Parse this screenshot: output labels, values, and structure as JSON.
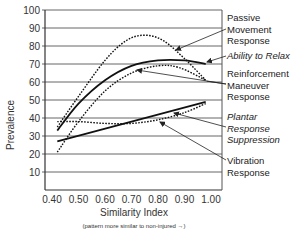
{
  "chart_data": {
    "type": "line",
    "title": "",
    "xlabel": "Similarity Index",
    "xlabel_note": "(pattern more similar to non-injured →)",
    "ylabel": "Prevalence",
    "xlim": [
      0.4,
      1.0
    ],
    "ylim": [
      0,
      100
    ],
    "xticks": [
      "0.40",
      "0.50",
      "0.60",
      "0.70",
      "0.80",
      "0.90",
      "1.00"
    ],
    "yticks": [
      "10",
      "20",
      "30",
      "40",
      "50",
      "60",
      "70",
      "80",
      "90",
      "100"
    ],
    "grid": "horizontal",
    "legend_position": "right (annotated with arrows)",
    "series": [
      {
        "name": "Passive Movement Response",
        "style": "dotted",
        "x": [
          0.42,
          0.5,
          0.6,
          0.68,
          0.75,
          0.82,
          0.9,
          0.98
        ],
        "values": [
          35,
          52,
          72,
          83,
          86,
          83,
          73,
          61
        ]
      },
      {
        "name": "Ability to Relax",
        "style": "solid",
        "italic_label": true,
        "x": [
          0.42,
          0.5,
          0.6,
          0.7,
          0.8,
          0.9,
          0.98
        ],
        "values": [
          33,
          48,
          61,
          69,
          72,
          72,
          70
        ]
      },
      {
        "name": "Reinforcement Maneuver Response",
        "style": "dotted",
        "x": [
          0.42,
          0.5,
          0.6,
          0.7,
          0.8,
          0.88,
          0.98
        ],
        "values": [
          21,
          38,
          55,
          65,
          69,
          68,
          61
        ]
      },
      {
        "name": "Plantar Response Suppression",
        "style": "dotted",
        "italic_label": true,
        "x": [
          0.42,
          0.5,
          0.6,
          0.7,
          0.8,
          0.9,
          0.98
        ],
        "values": [
          38,
          38,
          37,
          37,
          39,
          43,
          48
        ]
      },
      {
        "name": "Vibration Response",
        "style": "solid",
        "x": [
          0.42,
          0.98
        ],
        "values": [
          27,
          49
        ]
      }
    ]
  },
  "labels": {
    "passive": [
      "Passive",
      "Movement",
      "Response"
    ],
    "relax": [
      "Ability to Relax"
    ],
    "reinforcement": [
      "Reinforcement",
      "Maneuver",
      "Response"
    ],
    "plantar": [
      "Plantar",
      "Response",
      "Suppression"
    ],
    "vibration": [
      "Vibration",
      "Response"
    ]
  }
}
